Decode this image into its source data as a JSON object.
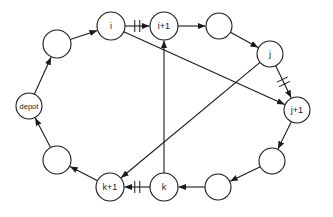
{
  "diagram": {
    "title": "",
    "nodes": [
      {
        "id": "depot",
        "label": "depot",
        "x": 29,
        "y": 106,
        "r": 13
      },
      {
        "id": "n1",
        "label": "",
        "x": 57,
        "y": 44,
        "r": 14
      },
      {
        "id": "i",
        "label": "i",
        "x": 111,
        "y": 26,
        "r": 14
      },
      {
        "id": "i1",
        "label": "i+1",
        "x": 164,
        "y": 26,
        "r": 14
      },
      {
        "id": "n2",
        "label": "",
        "x": 219,
        "y": 26,
        "r": 13
      },
      {
        "id": "j",
        "label": "j",
        "x": 270,
        "y": 54,
        "r": 13
      },
      {
        "id": "j1",
        "label": "j+1",
        "x": 297,
        "y": 110,
        "r": 13
      },
      {
        "id": "n3",
        "label": "",
        "x": 272,
        "y": 161,
        "r": 13
      },
      {
        "id": "n4",
        "label": "",
        "x": 218,
        "y": 187,
        "r": 13
      },
      {
        "id": "k",
        "label": "k",
        "x": 164,
        "y": 187,
        "r": 14
      },
      {
        "id": "k1",
        "label": "k+1",
        "x": 110,
        "y": 187,
        "r": 14
      },
      {
        "id": "n5",
        "label": "",
        "x": 57,
        "y": 160,
        "r": 14
      }
    ],
    "edges": [
      {
        "from": "depot",
        "to": "n1",
        "removed": false
      },
      {
        "from": "n1",
        "to": "i",
        "removed": false
      },
      {
        "from": "i",
        "to": "i1",
        "removed": true
      },
      {
        "from": "i1",
        "to": "n2",
        "removed": false
      },
      {
        "from": "n2",
        "to": "j",
        "removed": false
      },
      {
        "from": "j",
        "to": "j1",
        "removed": true
      },
      {
        "from": "j1",
        "to": "n3",
        "removed": false
      },
      {
        "from": "n3",
        "to": "n4",
        "removed": false
      },
      {
        "from": "n4",
        "to": "k",
        "removed": false
      },
      {
        "from": "k",
        "to": "k1",
        "removed": true
      },
      {
        "from": "k1",
        "to": "n5",
        "removed": false
      },
      {
        "from": "n5",
        "to": "depot",
        "removed": false
      },
      {
        "from": "i",
        "to": "j1",
        "removed": false,
        "new": true
      },
      {
        "from": "j",
        "to": "k1",
        "removed": false,
        "new": true
      },
      {
        "from": "k",
        "to": "i1",
        "removed": false,
        "new": true
      }
    ],
    "colors": {
      "stroke": "#1a1a1a",
      "background": "#ffffff"
    }
  }
}
